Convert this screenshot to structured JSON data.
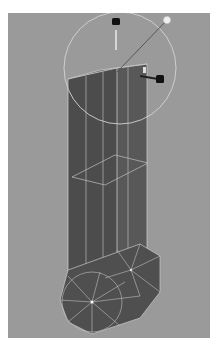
{
  "viewport": {
    "background": "#9a9a9a",
    "mesh_color": "#555555",
    "wire_color": "#c8c8c8",
    "manipulator_ring_color": "#d0d0d0",
    "light_color": "#f0f0f0"
  },
  "icons": {
    "scale_handle_top": "scale-handle",
    "scale_handle_right": "scale-handle",
    "light_sphere": "light-source"
  }
}
